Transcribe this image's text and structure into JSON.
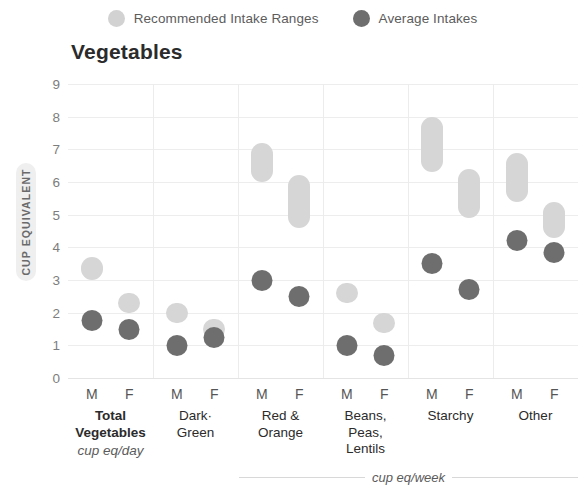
{
  "legend": {
    "items": [
      {
        "label": "Recommended Intake Ranges",
        "swatch": "range",
        "color": "#d2d2d2"
      },
      {
        "label": "Average Intakes",
        "swatch": "avg",
        "color": "#6e6e6e"
      }
    ]
  },
  "chart_data": {
    "type": "range-dot",
    "title": "Vegetables",
    "xlabel": "",
    "ylabel": "CUP EQUIVALENT",
    "ylim": [
      0,
      9
    ],
    "yticks": [
      9,
      8,
      7,
      6,
      5,
      4,
      3,
      2,
      1,
      0
    ],
    "grid": true,
    "legend_position": "top-center",
    "colors": {
      "range": "#d6d6d6",
      "average": "#6e6e6e"
    },
    "sex_labels": [
      "M",
      "F"
    ],
    "groups": [
      {
        "name": "Total Vegetables",
        "name_lines": [
          "Total",
          "Vegetables"
        ],
        "bold": true,
        "unit": "cup eq/day",
        "points": [
          {
            "sex": "M",
            "range_low": 3.0,
            "range_high": 3.7,
            "average": 1.75
          },
          {
            "sex": "F",
            "range_low": 2.0,
            "range_high": 2.6,
            "average": 1.5
          }
        ]
      },
      {
        "name": "Dark-Green",
        "name_lines": [
          "Dark·",
          "Green"
        ],
        "bold": false,
        "unit": "cup eq/week",
        "points": [
          {
            "sex": "M",
            "range_low": 1.8,
            "range_high": 2.3,
            "average": 1.0
          },
          {
            "sex": "F",
            "range_low": 1.5,
            "range_high": 1.8,
            "average": 1.25
          }
        ]
      },
      {
        "name": "Red & Orange",
        "name_lines": [
          "Red &",
          "Orange"
        ],
        "bold": false,
        "unit": "cup eq/week",
        "points": [
          {
            "sex": "M",
            "range_low": 6.0,
            "range_high": 7.2,
            "average": 3.0
          },
          {
            "sex": "F",
            "range_low": 4.6,
            "range_high": 6.2,
            "average": 2.5
          }
        ]
      },
      {
        "name": "Beans, Peas, Lentils",
        "name_lines": [
          "Beans,",
          "Peas,",
          "Lentils"
        ],
        "bold": false,
        "unit": "cup eq/week",
        "points": [
          {
            "sex": "M",
            "range_low": 2.3,
            "range_high": 2.9,
            "average": 1.0
          },
          {
            "sex": "F",
            "range_low": 1.6,
            "range_high": 2.0,
            "average": 0.7
          }
        ]
      },
      {
        "name": "Starchy",
        "name_lines": [
          "Starchy"
        ],
        "bold": false,
        "unit": "cup eq/week",
        "points": [
          {
            "sex": "M",
            "range_low": 6.3,
            "range_high": 8.0,
            "average": 3.5
          },
          {
            "sex": "F",
            "range_low": 4.9,
            "range_high": 6.4,
            "average": 2.7
          }
        ]
      },
      {
        "name": "Other",
        "name_lines": [
          "Other"
        ],
        "bold": false,
        "unit": "cup eq/week",
        "points": [
          {
            "sex": "M",
            "range_low": 5.4,
            "range_high": 6.9,
            "average": 4.2
          },
          {
            "sex": "F",
            "range_low": 4.3,
            "range_high": 5.4,
            "average": 3.85
          }
        ]
      }
    ],
    "week_unit_label": "cup eq/week",
    "week_unit_groups": [
      "Dark-Green",
      "Red & Orange",
      "Beans, Peas, Lentils",
      "Starchy",
      "Other"
    ]
  }
}
